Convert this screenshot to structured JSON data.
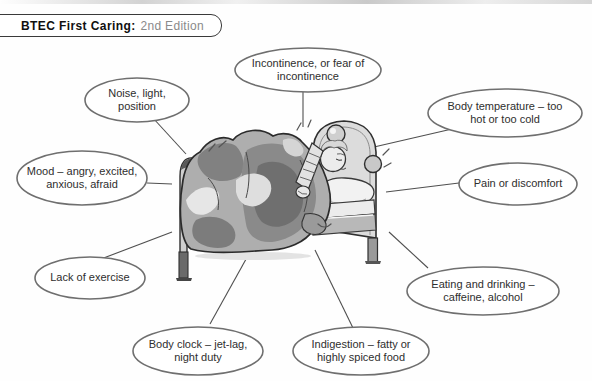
{
  "header": {
    "title_bold": "BTEC First Caring:",
    "edition": "2nd Edition"
  },
  "diagram": {
    "illustration_name": "person-awake-in-bed",
    "bubbles": [
      {
        "id": "noise",
        "label": "Noise, light,\nposition"
      },
      {
        "id": "incontinence",
        "label": "Incontinence, or fear of\nincontinence"
      },
      {
        "id": "body-temp",
        "label": "Body temperature – too\nhot or too cold"
      },
      {
        "id": "mood",
        "label": "Mood – angry, excited,\nanxious, afraid"
      },
      {
        "id": "pain",
        "label": "Pain or discomfort"
      },
      {
        "id": "exercise",
        "label": "Lack of exercise"
      },
      {
        "id": "eating",
        "label": "Eating and drinking –\ncaffeine, alcohol"
      },
      {
        "id": "body-clock",
        "label": "Body clock – jet-lag,\nnight duty"
      },
      {
        "id": "indigestion",
        "label": "Indigestion – fatty or\nhighly spiced food"
      }
    ]
  },
  "colors": {
    "bubble_outline": "#6f6f6f",
    "connector_line": "#4f4f4f",
    "label_text": "#2e2e2e",
    "edition_text": "#8a8a8a"
  }
}
